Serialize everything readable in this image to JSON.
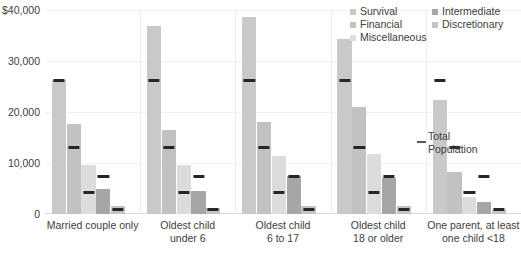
{
  "chart_data": {
    "type": "bar",
    "title": "",
    "xlabel": "",
    "ylabel": "",
    "ylim": [
      0,
      40000
    ],
    "grid": true,
    "legend_position": "top-right",
    "categories": [
      "Married couple only",
      "Oldest child under 6",
      "Oldest child 6 to 17",
      "Oldest child 18 or older",
      "One parent, at least one child <18"
    ],
    "category_lines": [
      [
        "Married couple only"
      ],
      [
        "Oldest child",
        "under 6"
      ],
      [
        "Oldest child",
        "6 to 17"
      ],
      [
        "Oldest child",
        "18 or older"
      ],
      [
        "One parent, at least",
        "one child <18"
      ]
    ],
    "series": [
      {
        "name": "Survival",
        "color": "#c9c9c9",
        "values": [
          26200,
          36800,
          38600,
          34400,
          22300
        ]
      },
      {
        "name": "Financial",
        "color": "#c2c2c2",
        "values": [
          17600,
          16500,
          18000,
          21000,
          8300
        ]
      },
      {
        "name": "Miscellaneous",
        "color": "#dcdcdc",
        "values": [
          9700,
          9700,
          11400,
          11700,
          3400
        ]
      },
      {
        "name": "Intermediate",
        "color": "#a6a6a6",
        "values": [
          5000,
          4500,
          7400,
          7100,
          2400
        ]
      },
      {
        "name": "Discretionary",
        "color": "#c4c4c4",
        "values": [
          1500,
          1200,
          1500,
          1500,
          700
        ]
      }
    ],
    "reference_markers": {
      "label": "Total Population",
      "label_lines": [
        "Total",
        "Population"
      ],
      "color": "#262626",
      "values": [
        26100,
        13000,
        4200,
        7300,
        800
      ]
    },
    "y_ticks": [
      {
        "value": 40000,
        "label": "$40,000"
      },
      {
        "value": 30000,
        "label": "30,000"
      },
      {
        "value": 20000,
        "label": "20,000"
      },
      {
        "value": 10000,
        "label": "10,000"
      },
      {
        "value": 0,
        "label": "0"
      }
    ]
  },
  "legend": {
    "columns": [
      {
        "entries": [
          "Survival",
          "Financial",
          "Miscellaneous"
        ]
      },
      {
        "entries": [
          "Intermediate",
          "Discretionary"
        ]
      }
    ]
  }
}
